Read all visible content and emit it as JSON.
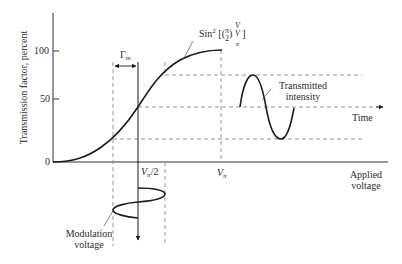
{
  "figure": {
    "type": "electro-optic modulator transfer characteristic",
    "y_axis": {
      "label": "Transmission factor, percent",
      "ticks": [
        "0",
        "50",
        "100"
      ]
    },
    "x_axis": {
      "label_line1": "Applied",
      "label_line2": "voltage",
      "ticks": [
        {
          "symbol": "V",
          "sub": "π",
          "suffix": "/2"
        },
        {
          "symbol": "V",
          "sub": "π",
          "suffix": ""
        }
      ]
    },
    "curve_label": {
      "prefix": "Sin",
      "power": "2",
      "open": " [(",
      "frac1_num": "π",
      "frac1_den": "2",
      "mid": ") ",
      "frac2_num": "V",
      "frac2_den": "V",
      "frac2_den_sub": "π",
      "close": " ]"
    },
    "gamma_label": {
      "symbol": "Γ",
      "sub": "m"
    },
    "output_label_line1": "Transmitted",
    "output_label_line2": "intensity",
    "time_label": "Time",
    "modulation_label_line1": "Modulation",
    "modulation_label_line2": "voltage",
    "colors": {
      "line": "#1a1a1a",
      "dashed": "#8a8a8a",
      "background": "#ffffff"
    }
  }
}
